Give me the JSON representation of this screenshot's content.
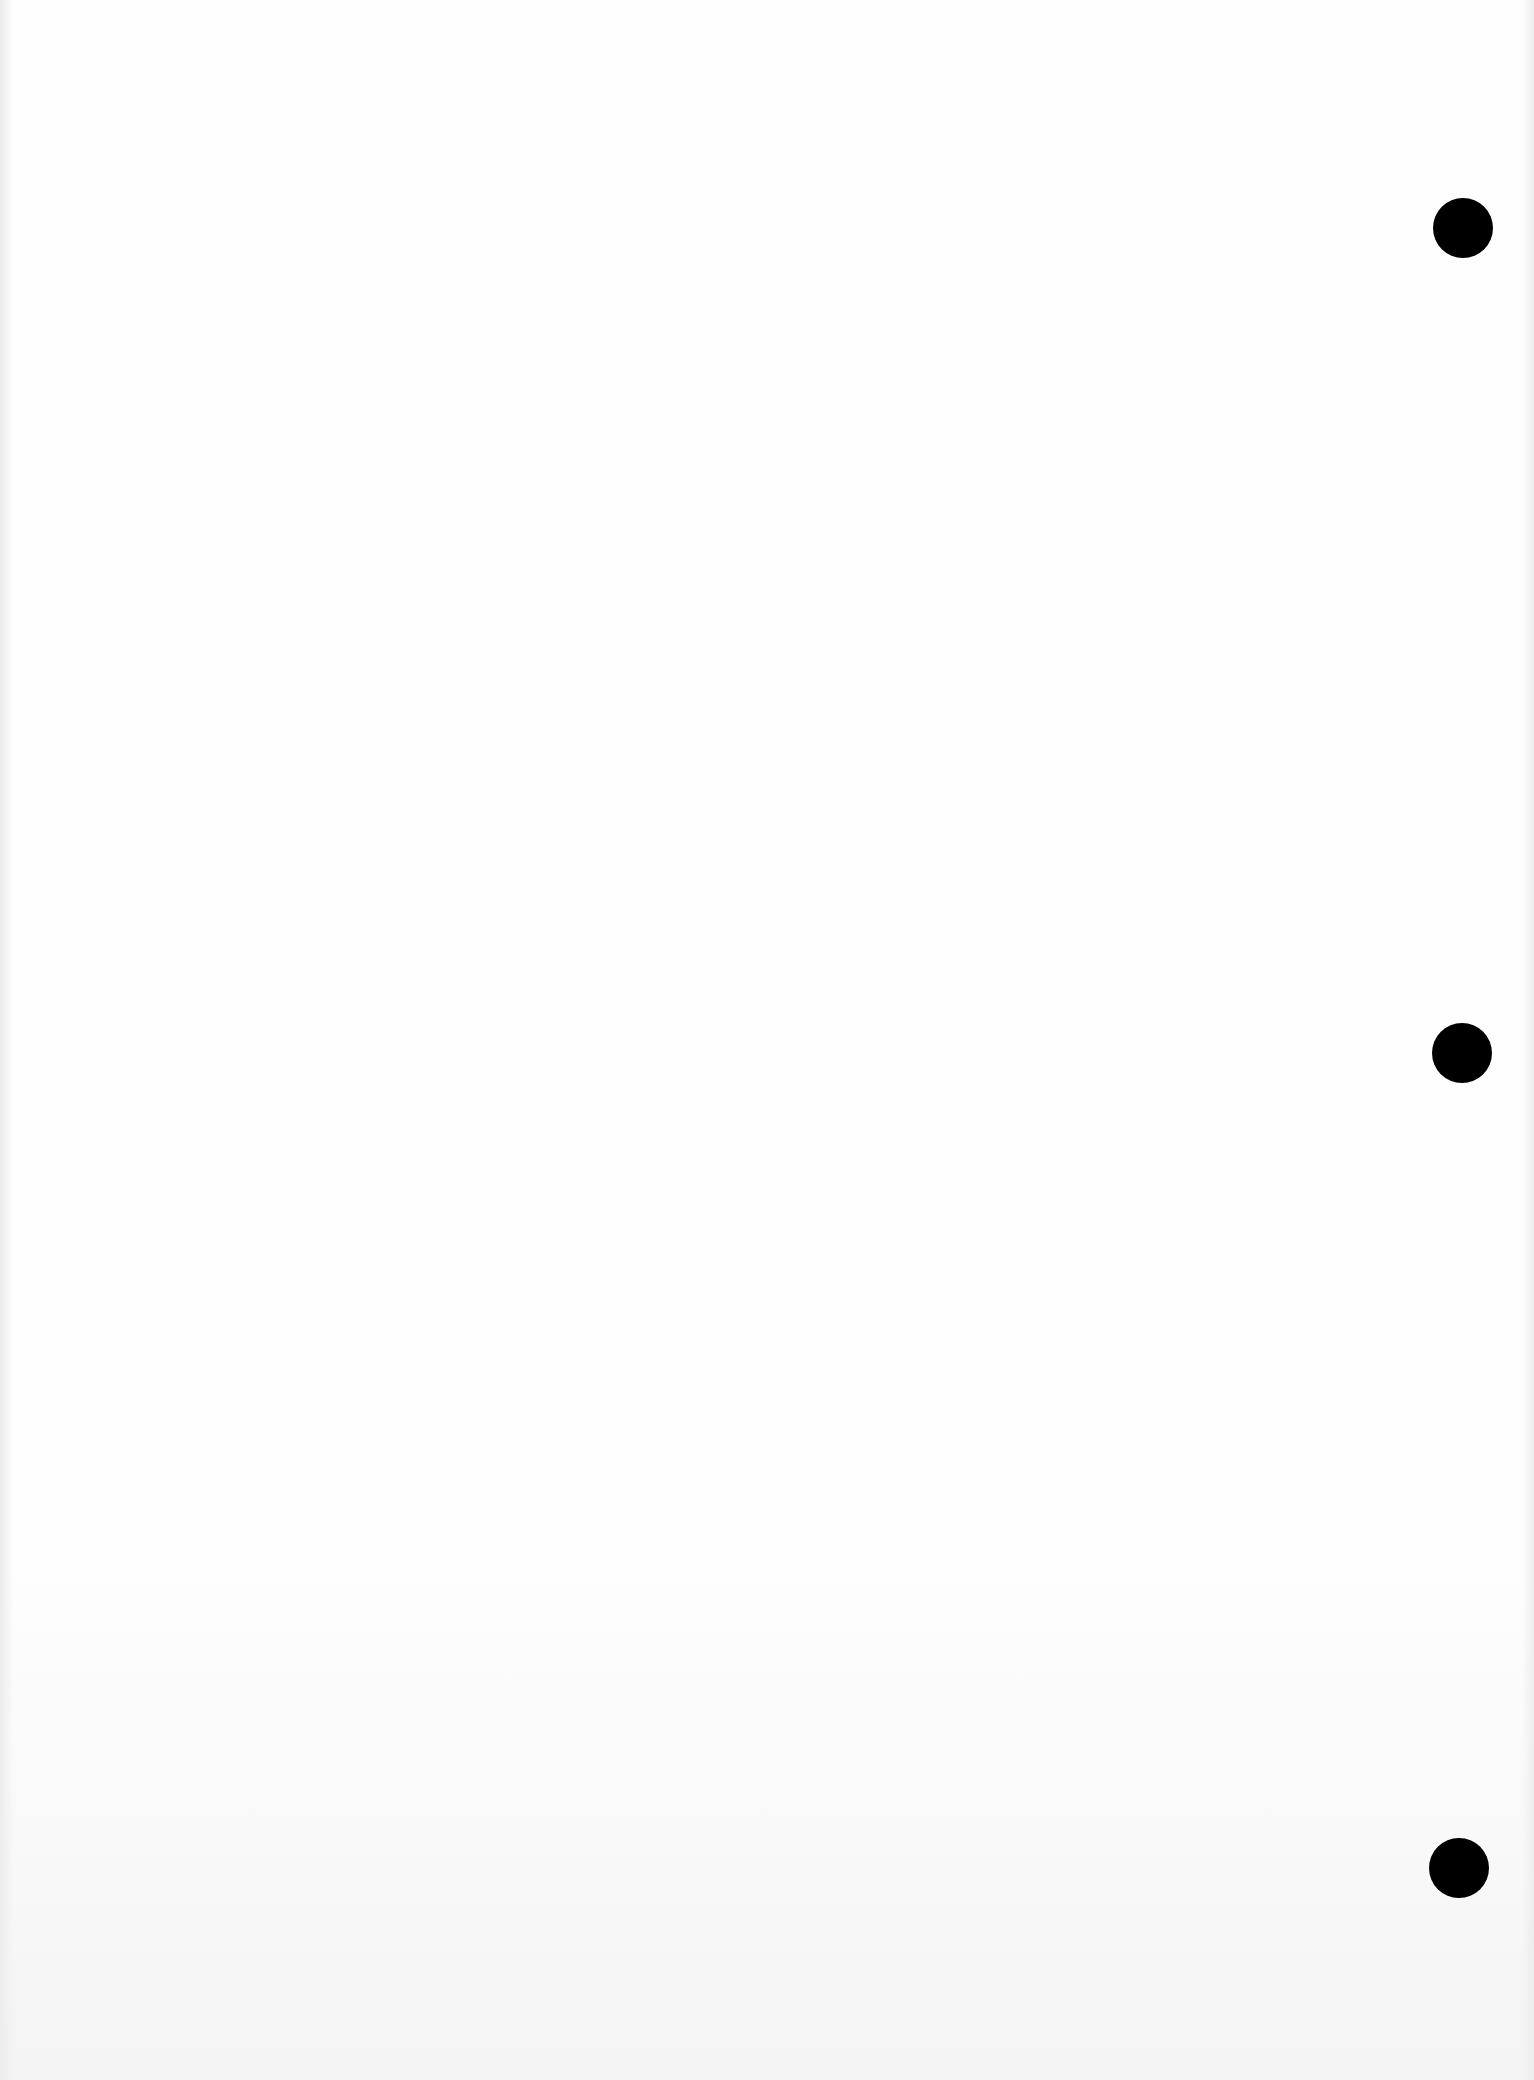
{
  "document": {
    "type": "blank scanned page",
    "text": "",
    "background_color": "#fefefe"
  },
  "punch_holes": [
    {
      "cx": 1463,
      "cy": 228,
      "r": 30,
      "color": "#000000"
    },
    {
      "cx": 1462,
      "cy": 1053,
      "r": 30,
      "color": "#000000"
    },
    {
      "cx": 1459,
      "cy": 1868,
      "r": 30,
      "color": "#000000"
    }
  ]
}
